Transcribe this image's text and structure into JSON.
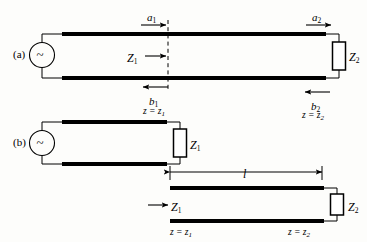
{
  "figure": {
    "background": "#fdfdfb",
    "ink": "#000000",
    "width": 367,
    "height": 242
  },
  "panels": [
    {
      "id": "a",
      "label": "(a)"
    },
    {
      "id": "b",
      "label": "(b)"
    }
  ],
  "panel_a": {
    "source_symbol": "~",
    "wave_incident_near": "a",
    "wave_incident_near_sub": "1",
    "wave_incident_far": "a",
    "wave_incident_far_sub": "2",
    "wave_reflected_near": "b",
    "wave_reflected_near_sub": "1",
    "wave_reflected_far": "b",
    "wave_reflected_far_sub": "2",
    "impedance_left": "Z",
    "impedance_left_sub": "1",
    "impedance_right": "Z",
    "impedance_right_sub": "2",
    "plane_near_eq": "z = z",
    "plane_near_sub": "1",
    "plane_far_eq": "z = z",
    "plane_far_sub": "2"
  },
  "panel_b": {
    "source_symbol": "~",
    "load_impedance": "Z",
    "load_impedance_sub": "1",
    "length_label": "l",
    "input_impedance": "Z",
    "input_impedance_sub": "1",
    "terminating_impedance": "Z",
    "terminating_impedance_sub": "2",
    "plane_near_eq": "z = z",
    "plane_near_sub": "1",
    "plane_far_eq": "z = z",
    "plane_far_sub": "2"
  }
}
